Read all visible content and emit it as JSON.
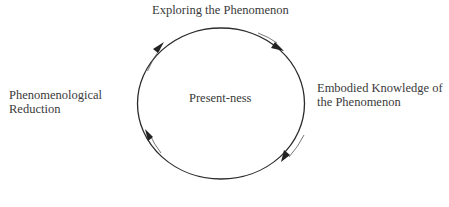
{
  "diagram": {
    "type": "cycle",
    "direction": "clockwise",
    "center_label": "Present-ness",
    "nodes": [
      {
        "position": "top",
        "lines": [
          "Exploring the Phenomenon"
        ]
      },
      {
        "position": "right",
        "lines": [
          "Embodied Knowledge of",
          "the Phenomenon"
        ]
      },
      {
        "position": "bottom",
        "lines": [
          "..."
        ],
        "note": "cut off at image edge"
      },
      {
        "position": "left",
        "lines": [
          "Phenomenological",
          "Reduction"
        ]
      }
    ],
    "edges": [
      {
        "from": "left",
        "to": "top"
      },
      {
        "from": "top",
        "to": "right"
      },
      {
        "from": "right",
        "to": "bottom"
      },
      {
        "from": "bottom",
        "to": "left"
      }
    ],
    "colors": {
      "stroke": "#2b2b2b",
      "text": "#3a3a3a",
      "background": "#ffffff"
    }
  }
}
